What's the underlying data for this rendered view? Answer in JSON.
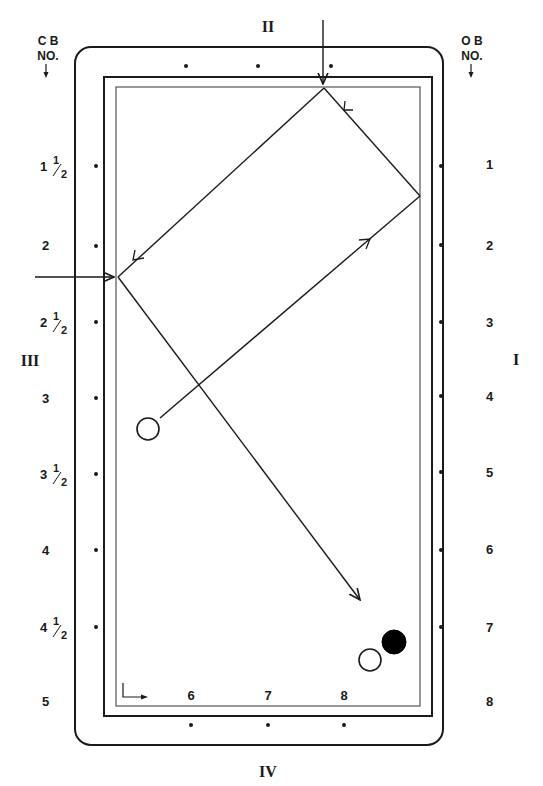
{
  "diagram": {
    "type": "billiards-three-cushion-system",
    "header_left": {
      "line1": "C B",
      "line2": "NO.",
      "arrow": "down-arrow"
    },
    "header_right": {
      "line1": "O B",
      "line2": "NO.",
      "arrow": "down-arrow"
    },
    "rail_labels": {
      "top": "II",
      "right": "I",
      "left": "III",
      "bottom": "IV"
    },
    "cue_ball_numbers": [
      {
        "whole": "1",
        "frac": true
      },
      {
        "whole": "2",
        "frac": false
      },
      {
        "whole": "2",
        "frac": true
      },
      {
        "whole": "3",
        "frac": false
      },
      {
        "whole": "3",
        "frac": true
      },
      {
        "whole": "4",
        "frac": false
      },
      {
        "whole": "4",
        "frac": true
      },
      {
        "whole": "5",
        "frac": false
      }
    ],
    "fraction": {
      "num": "1",
      "den": "2"
    },
    "object_ball_numbers": [
      "1",
      "2",
      "3",
      "4",
      "5",
      "6",
      "7",
      "8"
    ],
    "bottom_numbers": [
      "6",
      "7",
      "8"
    ],
    "balls": {
      "cue_ball": {
        "color": "#ffffff",
        "label": "cue ball"
      },
      "second_ball": {
        "color": "#ffffff",
        "label": "white object ball"
      },
      "target_ball": {
        "color": "#000000",
        "label": "black object ball"
      }
    },
    "colors": {
      "line": "#1a1a1a",
      "cushion": "#555555",
      "background": "#ffffff"
    }
  }
}
